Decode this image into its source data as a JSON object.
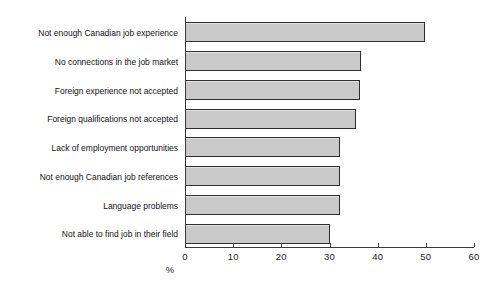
{
  "chart_data": {
    "type": "bar",
    "orientation": "horizontal",
    "title": "",
    "xlabel": "%",
    "ylabel": "",
    "xlim": [
      0,
      60
    ],
    "xticks": [
      0,
      10,
      20,
      30,
      40,
      50,
      60
    ],
    "xtick_labels": [
      "0",
      "10",
      "20",
      "30",
      "40",
      "50",
      "60"
    ],
    "grid": false,
    "legend": "none",
    "bar_fill_color": "#c9c9c9",
    "bar_edge_color": "#2e2e2e",
    "categories": [
      "Not enough Canadian job experience",
      "No connections in the job market",
      "Foreign experience not accepted",
      "Foreign qualifications not accepted",
      "Lack of employment opportunities",
      "Not enough Canadian job references",
      "Language problems",
      "Not able to find job in their field"
    ],
    "values": [
      49.8,
      36.5,
      36.3,
      35.4,
      32.2,
      32.2,
      32.1,
      30.1
    ]
  }
}
